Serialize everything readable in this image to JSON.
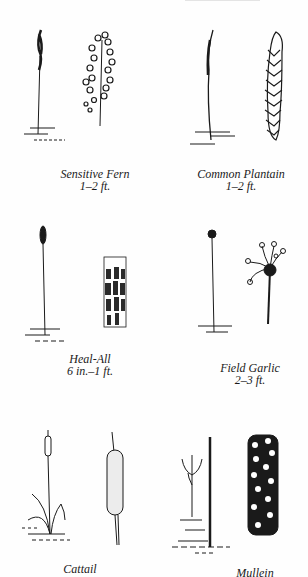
{
  "page": {
    "type": "field guide illustration plate",
    "ink_color": "#1a1a1a",
    "background": "#ffffff"
  },
  "plants": [
    {
      "name": "Sensitive Fern",
      "size": "1–2 ft.",
      "views": [
        "whole-plant",
        "fertile-frond-detail"
      ]
    },
    {
      "name": "Common Plantain",
      "size": "1–2 ft.",
      "views": [
        "whole-plant",
        "flower-spike-detail"
      ]
    },
    {
      "name": "Heal-All",
      "size": "6 in.–1 ft.",
      "views": [
        "whole-plant",
        "flower-head-detail"
      ]
    },
    {
      "name": "Field Garlic",
      "size": "2–3 ft.",
      "views": [
        "whole-plant",
        "flower-umbel-detail"
      ]
    },
    {
      "name": "Cattail",
      "size": "",
      "views": [
        "whole-plant",
        "seed-head-detail"
      ]
    },
    {
      "name": "Mullein",
      "size": "",
      "views": [
        "whole-plant",
        "flower-spike-detail"
      ]
    }
  ]
}
